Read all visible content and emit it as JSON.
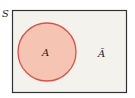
{
  "diagram": {
    "type": "venn",
    "universe_label": "S",
    "sets": [
      {
        "name": "A",
        "label": "A",
        "fill": "#f5c4b3",
        "stroke": "#d9534a"
      }
    ],
    "complement_label": "Ā",
    "universe_fill": "#f4f2ec",
    "universe_stroke": "#333333"
  }
}
